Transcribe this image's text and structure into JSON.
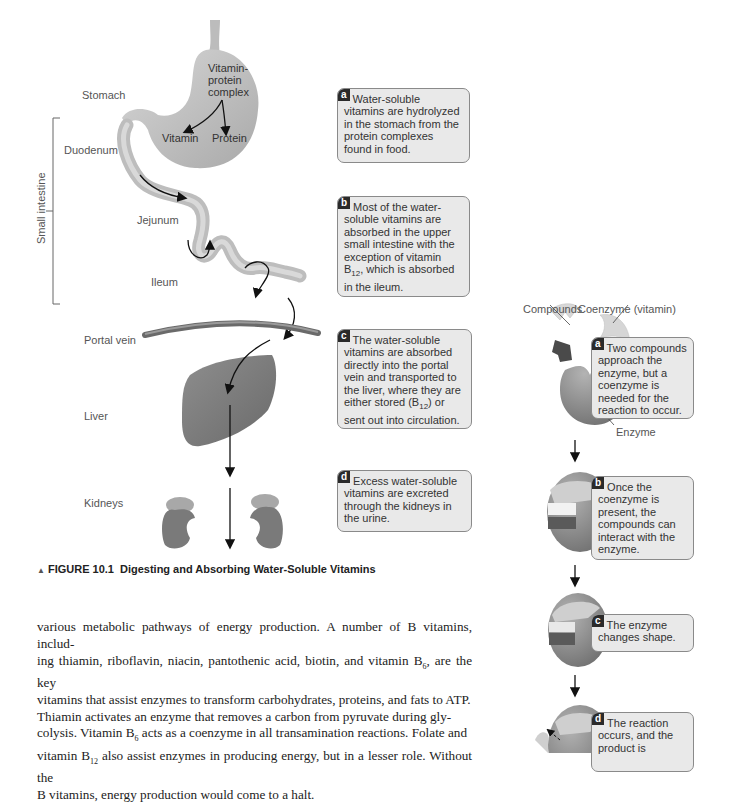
{
  "figure": {
    "marker": "▲",
    "number": "FIGURE 10.1",
    "title": "Digesting and Absorbing Water-Soluble Vitamins"
  },
  "digestion_diagram": {
    "organ_labels": {
      "stomach": "Stomach",
      "duodenum": "Duodenum",
      "jejunum": "Jejunum",
      "ileum": "Ileum",
      "portal_vein": "Portal vein",
      "liver": "Liver",
      "kidneys": "Kidneys",
      "small_intestine": "Small intestine"
    },
    "stomach_labels": {
      "complex_line1": "Vitamin-",
      "complex_line2": "protein",
      "complex_line3": "complex",
      "vitamin": "Vitamin",
      "protein": "Protein"
    },
    "callouts": [
      {
        "letter": "a",
        "text": "Water-soluble vitamins are hydrolyzed in the stomach from the protein complexes found in food."
      },
      {
        "letter": "b",
        "text_before": "Most of the water-soluble vitamins are absorbed in the upper small intestine with the exception of vitamin B",
        "sub": "12",
        "text_after": ", which is absorbed in the ileum."
      },
      {
        "letter": "c",
        "text_before": "The water-soluble vitamins are absorbed directly into the portal vein and transported to the liver, where they are either stored (B",
        "sub": "12",
        "text_after": ") or sent out into circulation."
      },
      {
        "letter": "d",
        "text": "Excess water-soluble vitamins are excreted through the kidneys in the urine."
      }
    ]
  },
  "enzyme_diagram": {
    "labels": {
      "compounds": "Compounds",
      "coenzyme": "Coenzyme (vitamin)",
      "enzyme": "Enzyme"
    },
    "callouts": [
      {
        "letter": "a",
        "text": "Two compounds approach the enzyme, but a coenzyme is needed for the reaction to occur."
      },
      {
        "letter": "b",
        "text": "Once the coenzyme is present, the compounds can interact with the enzyme."
      },
      {
        "letter": "c",
        "text": "The enzyme changes shape."
      },
      {
        "letter": "d",
        "text": "The reaction occurs, and the product is"
      }
    ]
  },
  "body": {
    "l1": "various metabolic pathways of energy production. A number of B vitamins, includ-",
    "l2a": "ing thiamin, riboflavin, niacin, pantothenic acid, biotin, and vitamin B",
    "l2sub": "6",
    "l2b": ", are the key",
    "l3": "vitamins that assist enzymes to transform carbohydrates, proteins, and fats to ATP.",
    "l4": "Thiamin activates an enzyme that removes a carbon from pyruvate during gly-",
    "l5a": "colysis. Vitamin B",
    "l5sub": "6",
    "l5b": " acts as a coenzyme in all transamination reactions. Folate and",
    "l6a": "vitamin B",
    "l6sub": "12",
    "l6b": " also assist enzymes in producing energy, but in a lesser role. Without the",
    "l7": "B vitamins, energy production would come to a halt."
  },
  "colors": {
    "callout_bg": "#e9e9e9",
    "callout_border": "#8a8a8a",
    "badge_bg": "#2a2a2a",
    "organ_gray": "#bdbdbd",
    "liver_gray": "#7a7a7a",
    "enzyme_gray": "#8c8c8c",
    "coenzyme_light": "#d6d6d6"
  }
}
